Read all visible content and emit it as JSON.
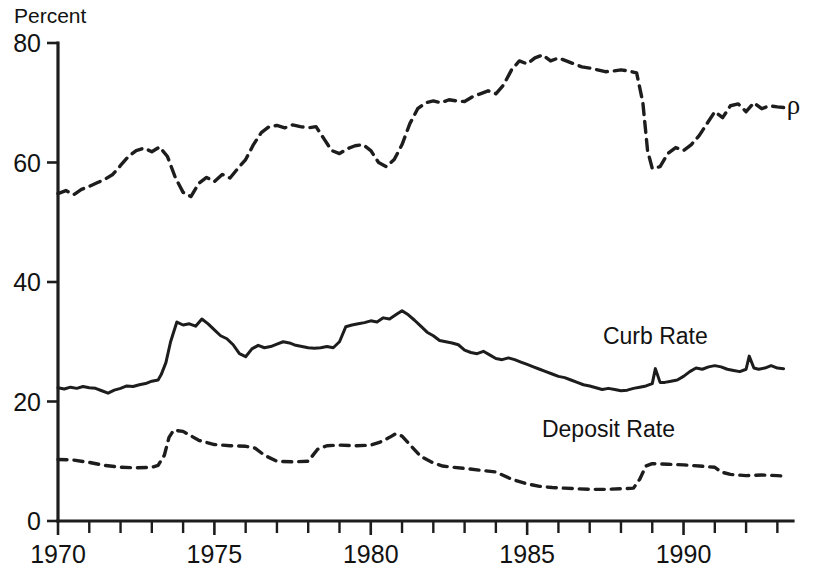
{
  "chart_data": {
    "type": "line",
    "title": "",
    "subtitle": "",
    "xlabel": "",
    "ylabel": "Percent",
    "ylim": [
      0,
      80
    ],
    "xlim": [
      1970.0,
      1993.5
    ],
    "yticks": [
      0,
      20,
      40,
      60,
      80
    ],
    "ytick_labels": [
      "0",
      "20",
      "40",
      "60",
      "80"
    ],
    "xticks": [
      1970,
      1971,
      1972,
      1973,
      1974,
      1975,
      1976,
      1977,
      1978,
      1979,
      1980,
      1981,
      1982,
      1983,
      1984,
      1985,
      1986,
      1987,
      1988,
      1989,
      1990,
      1991,
      1992,
      1993
    ],
    "xtick_labels_shown": [
      "1970",
      "1975",
      "1980",
      "1985",
      "1990"
    ],
    "xtick_labels_years": [
      1970,
      1975,
      1980,
      1985,
      1990
    ],
    "grid": false,
    "legend_position": "inline-right",
    "series": [
      {
        "name": "rho",
        "label": "ρ",
        "style": "dashed-long",
        "color": "#1d1d1d",
        "label_x": 1993.3,
        "label_y": 69.5,
        "x": [
          1970.0,
          1970.25,
          1970.5,
          1970.75,
          1971.0,
          1971.25,
          1971.5,
          1971.75,
          1972.0,
          1972.25,
          1972.5,
          1972.75,
          1973.0,
          1973.25,
          1973.5,
          1973.75,
          1974.0,
          1974.25,
          1974.5,
          1974.75,
          1975.0,
          1975.25,
          1975.5,
          1975.75,
          1976.0,
          1976.25,
          1976.5,
          1976.75,
          1977.0,
          1977.25,
          1977.5,
          1977.75,
          1978.0,
          1978.25,
          1978.5,
          1978.75,
          1979.0,
          1979.25,
          1979.5,
          1979.75,
          1980.0,
          1980.25,
          1980.5,
          1980.75,
          1981.0,
          1981.25,
          1981.5,
          1981.75,
          1982.0,
          1982.25,
          1982.5,
          1982.75,
          1983.0,
          1983.25,
          1983.5,
          1983.75,
          1984.0,
          1984.25,
          1984.5,
          1984.75,
          1985.0,
          1985.25,
          1985.5,
          1985.75,
          1986.0,
          1986.25,
          1986.5,
          1986.75,
          1987.0,
          1987.25,
          1987.5,
          1987.75,
          1988.0,
          1988.25,
          1988.5,
          1988.7,
          1988.85,
          1989.0,
          1989.25,
          1989.5,
          1989.75,
          1990.0,
          1990.25,
          1990.5,
          1990.75,
          1991.0,
          1991.25,
          1991.5,
          1991.75,
          1992.0,
          1992.25,
          1992.5,
          1992.75,
          1993.0,
          1993.2
        ],
        "y": [
          54.8,
          55.3,
          54.6,
          55.5,
          56.0,
          56.6,
          57.2,
          58.0,
          59.5,
          61.0,
          62.0,
          62.4,
          61.8,
          62.6,
          61.0,
          57.5,
          55.0,
          54.3,
          56.5,
          57.5,
          56.8,
          58.0,
          57.4,
          59.0,
          60.5,
          63.0,
          65.0,
          66.0,
          66.2,
          65.8,
          66.3,
          66.0,
          65.8,
          66.0,
          64.0,
          62.0,
          61.5,
          62.3,
          62.8,
          63.0,
          62.0,
          60.0,
          59.3,
          60.5,
          63.0,
          66.5,
          69.0,
          70.0,
          70.3,
          70.0,
          70.5,
          70.3,
          70.2,
          71.0,
          71.5,
          72.0,
          71.5,
          73.0,
          75.5,
          77.0,
          76.5,
          77.5,
          78.0,
          77.0,
          77.5,
          77.0,
          76.5,
          76.0,
          75.8,
          75.5,
          75.2,
          75.3,
          75.5,
          75.3,
          75.0,
          70.0,
          62.0,
          59.0,
          59.3,
          61.5,
          62.5,
          62.0,
          63.0,
          64.5,
          66.5,
          68.5,
          67.5,
          69.5,
          69.8,
          68.5,
          70.0,
          69.0,
          69.5,
          69.3,
          69.2
        ]
      },
      {
        "name": "curb-rate",
        "label": "Curb Rate",
        "style": "solid",
        "color": "#1d1d1d",
        "label_x": 1989.1,
        "label_y": 29.6,
        "x": [
          1970.0,
          1970.2,
          1970.4,
          1970.6,
          1970.8,
          1971.0,
          1971.2,
          1971.4,
          1971.6,
          1971.8,
          1972.0,
          1972.2,
          1972.4,
          1972.6,
          1972.8,
          1973.0,
          1973.2,
          1973.3,
          1973.45,
          1973.6,
          1973.8,
          1974.0,
          1974.2,
          1974.4,
          1974.6,
          1974.8,
          1975.0,
          1975.2,
          1975.4,
          1975.6,
          1975.8,
          1976.0,
          1976.2,
          1976.4,
          1976.6,
          1976.8,
          1977.0,
          1977.2,
          1977.4,
          1977.6,
          1977.8,
          1978.0,
          1978.2,
          1978.4,
          1978.6,
          1978.8,
          1979.0,
          1979.2,
          1979.4,
          1979.6,
          1979.8,
          1980.0,
          1980.2,
          1980.4,
          1980.6,
          1980.8,
          1981.0,
          1981.2,
          1981.4,
          1981.6,
          1981.8,
          1982.0,
          1982.2,
          1982.4,
          1982.6,
          1982.8,
          1983.0,
          1983.2,
          1983.4,
          1983.6,
          1983.8,
          1984.0,
          1984.2,
          1984.4,
          1984.6,
          1984.8,
          1985.0,
          1985.2,
          1985.4,
          1985.6,
          1985.8,
          1986.0,
          1986.2,
          1986.4,
          1986.6,
          1986.8,
          1987.0,
          1987.2,
          1987.4,
          1987.6,
          1987.8,
          1988.0,
          1988.2,
          1988.4,
          1988.6,
          1988.8,
          1989.0,
          1989.1,
          1989.25,
          1989.4,
          1989.6,
          1989.8,
          1990.0,
          1990.2,
          1990.4,
          1990.6,
          1990.8,
          1991.0,
          1991.2,
          1991.4,
          1991.6,
          1991.8,
          1992.0,
          1992.1,
          1992.25,
          1992.4,
          1992.6,
          1992.8,
          1993.0,
          1993.2
        ],
        "y": [
          22.3,
          22.1,
          22.4,
          22.2,
          22.5,
          22.3,
          22.2,
          21.8,
          21.4,
          21.9,
          22.2,
          22.6,
          22.5,
          22.8,
          23.0,
          23.4,
          23.6,
          24.5,
          26.5,
          30.0,
          33.3,
          32.8,
          33.0,
          32.6,
          33.8,
          33.0,
          32.0,
          31.0,
          30.5,
          29.5,
          28.0,
          27.5,
          28.8,
          29.4,
          29.0,
          29.2,
          29.6,
          30.0,
          29.8,
          29.4,
          29.2,
          29.0,
          28.9,
          29.0,
          29.2,
          29.0,
          30.0,
          32.5,
          32.8,
          33.0,
          33.2,
          33.5,
          33.3,
          34.0,
          33.8,
          34.5,
          35.2,
          34.5,
          33.6,
          32.6,
          31.6,
          31.0,
          30.2,
          30.0,
          29.8,
          29.5,
          28.6,
          28.2,
          28.0,
          28.4,
          27.8,
          27.2,
          27.0,
          27.3,
          27.0,
          26.6,
          26.2,
          25.8,
          25.4,
          25.0,
          24.6,
          24.2,
          24.0,
          23.6,
          23.2,
          22.8,
          22.6,
          22.3,
          22.0,
          22.2,
          22.0,
          21.8,
          21.9,
          22.2,
          22.4,
          22.6,
          23.0,
          25.5,
          23.2,
          23.2,
          23.4,
          23.6,
          24.2,
          25.0,
          25.6,
          25.4,
          25.8,
          26.0,
          25.8,
          25.4,
          25.2,
          25.0,
          25.4,
          27.6,
          25.6,
          25.4,
          25.6,
          26.0,
          25.6,
          25.5
        ]
      },
      {
        "name": "deposit-rate",
        "label": "Deposit Rate",
        "style": "dashed-short",
        "color": "#1d1d1d",
        "label_x": 1987.6,
        "label_y": 14.0,
        "x": [
          1970.0,
          1970.5,
          1971.0,
          1971.5,
          1972.0,
          1972.5,
          1973.0,
          1973.2,
          1973.4,
          1973.55,
          1973.7,
          1974.0,
          1974.5,
          1975.0,
          1975.5,
          1976.0,
          1976.3,
          1976.6,
          1977.0,
          1977.5,
          1978.0,
          1978.3,
          1978.6,
          1979.0,
          1979.5,
          1980.0,
          1980.3,
          1980.6,
          1980.8,
          1981.0,
          1981.3,
          1981.6,
          1982.0,
          1982.3,
          1982.6,
          1983.0,
          1983.5,
          1984.0,
          1984.5,
          1985.0,
          1985.4,
          1985.8,
          1986.2,
          1986.6,
          1987.0,
          1987.5,
          1988.0,
          1988.4,
          1988.6,
          1988.8,
          1989.0,
          1989.5,
          1990.0,
          1990.5,
          1991.0,
          1991.2,
          1991.5,
          1992.0,
          1992.5,
          1993.0,
          1993.2
        ],
        "y": [
          10.3,
          10.2,
          9.8,
          9.3,
          9.0,
          8.9,
          9.0,
          9.3,
          11.0,
          14.0,
          15.2,
          15.0,
          13.5,
          12.8,
          12.6,
          12.5,
          12.2,
          11.0,
          10.0,
          9.9,
          10.0,
          12.0,
          12.6,
          12.7,
          12.6,
          12.7,
          13.2,
          14.0,
          14.6,
          14.2,
          12.5,
          10.8,
          9.7,
          9.2,
          9.0,
          8.8,
          8.5,
          8.2,
          7.0,
          6.2,
          5.8,
          5.6,
          5.5,
          5.4,
          5.3,
          5.3,
          5.4,
          5.5,
          7.0,
          9.2,
          9.6,
          9.5,
          9.4,
          9.2,
          9.0,
          8.2,
          7.8,
          7.6,
          7.7,
          7.6,
          7.5
        ]
      }
    ]
  },
  "axis": {
    "y_unit_label": "Percent"
  }
}
